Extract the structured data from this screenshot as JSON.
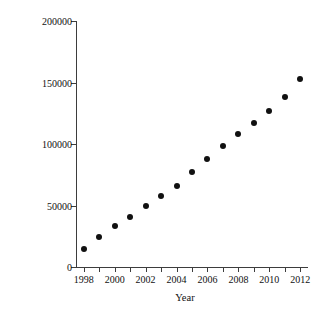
{
  "chart_data": {
    "type": "scatter",
    "title": "",
    "xlabel": "Year",
    "ylabel": "# of AP statistic exams taken",
    "xlim": [
      1997.5,
      2012.5
    ],
    "ylim": [
      0,
      200000
    ],
    "grid": false,
    "legend": null,
    "marker": {
      "shape": "circle",
      "color": "#111111",
      "size_px": 6
    },
    "axis_color": "#3d3d3d",
    "background": "#ffffff",
    "x_tick_values": [
      1998,
      1999,
      2000,
      2001,
      2002,
      2003,
      2004,
      2005,
      2006,
      2007,
      2008,
      2009,
      2010,
      2011,
      2012
    ],
    "x_tick_labels": [
      "1998",
      "",
      "2000",
      "",
      "2002",
      "",
      "2004",
      "",
      "2006",
      "",
      "2008",
      "",
      "2010",
      "",
      "2012"
    ],
    "y_tick_values": [
      0,
      50000,
      100000,
      150000,
      200000
    ],
    "y_tick_labels": [
      "0",
      "50000",
      "100000",
      "150000",
      "200000"
    ],
    "x": [
      1998,
      1999,
      2000,
      2001,
      2002,
      2003,
      2004,
      2005,
      2006,
      2007,
      2008,
      2009,
      2010,
      2011,
      2012
    ],
    "values": [
      15000,
      24500,
      33500,
      41000,
      49500,
      58000,
      66000,
      77000,
      88000,
      98500,
      108000,
      117000,
      126500,
      138500,
      152500
    ]
  }
}
